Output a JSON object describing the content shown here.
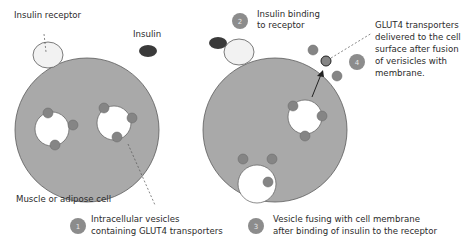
{
  "diagram": {
    "colors": {
      "cell_fill": "#a9a9a9",
      "cell_stroke": "#5a5a5a",
      "receptor_fill": "#f2f2f2",
      "insulin_fill": "#3a3a3a",
      "transporter_fill": "#858585",
      "badge_fill": "#8c8c8c",
      "text": "#2b2b2b"
    },
    "left_cell": {
      "label": "Muscle or adipose cell",
      "receptor_label": "Insulin receptor",
      "insulin_label": "Insulin"
    },
    "right_cell": {
      "step2_label_line1": "Insulin binding",
      "step2_label_line2": "to receptor",
      "step4_line1": "GLUT4 transporters",
      "step4_line2": "delivered to the cell",
      "step4_line3": "surface after fusion",
      "step4_line4": "of verisicles with",
      "step4_line5": "membrane."
    },
    "steps": [
      {
        "number": "1",
        "line1": "Intracellular vesicles",
        "line2": "containing GLUT4 transporters"
      },
      {
        "number": "2"
      },
      {
        "number": "3",
        "line1": "Vesicle fusing with cell membrane",
        "line2": "after binding of insulin to the receptor"
      },
      {
        "number": "4"
      }
    ]
  }
}
